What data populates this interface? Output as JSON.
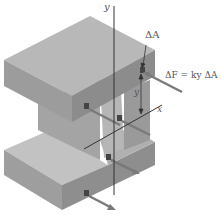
{
  "diagram": {
    "type": "beam-section-bending-stress",
    "labels": {
      "y_axis": "y",
      "x_axis": "x",
      "area_element": "ΔA",
      "force_equation": "ΔF = ky ΔA",
      "distance": "y"
    },
    "colors": {
      "top_face": "#b4b4b4",
      "front_face": "#9a9a9a",
      "side_face": "#888888",
      "web": "#a6a6a6",
      "arrow": "#777777",
      "axis": "#333333",
      "text": "#555555"
    }
  }
}
